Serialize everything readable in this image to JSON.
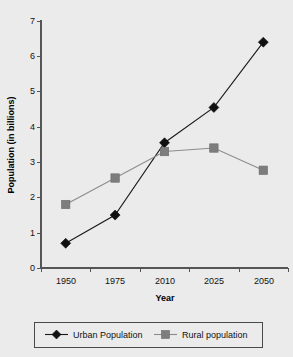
{
  "chart_data": {
    "type": "line",
    "title": "",
    "xlabel": "Year",
    "ylabel": "Population (in billions)",
    "categories": [
      "1950",
      "1975",
      "2010",
      "2025",
      "2050"
    ],
    "ylim": [
      0,
      7
    ],
    "yticks": [
      "0",
      "1",
      "2",
      "3",
      "4",
      "5",
      "6",
      "7"
    ],
    "grid": false,
    "legend_position": "bottom",
    "series": [
      {
        "name": "Urban Population",
        "marker": "diamond",
        "color": "#111111",
        "values": [
          0.7,
          1.5,
          3.55,
          4.55,
          6.4
        ]
      },
      {
        "name": "Rural population",
        "marker": "square",
        "color": "#7d7d7d",
        "values": [
          1.8,
          2.55,
          3.3,
          3.4,
          2.77
        ]
      }
    ]
  },
  "axes": {
    "y_axis_label": "Population (in billions)",
    "x_axis_label": "Year",
    "y_tick_labels": [
      "7",
      "6",
      "5",
      "4",
      "3",
      "2",
      "1",
      "0"
    ],
    "x_tick_labels": [
      "1950",
      "1975",
      "2010",
      "2025",
      "2050"
    ]
  },
  "legend": {
    "entries": [
      {
        "label": "Urban Population",
        "marker": "diamond-marker-icon"
      },
      {
        "label": "Rural population",
        "marker": "square-marker-icon"
      }
    ]
  },
  "colors": {
    "background": "#ebebeb",
    "urban": "#111111",
    "rural": "#7d7d7d",
    "axis": "#555555",
    "legend_border": "#4a4a4a"
  }
}
